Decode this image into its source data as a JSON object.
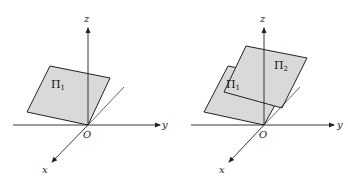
{
  "figure": {
    "colors": {
      "line": "#222222",
      "plane_fill": "#d9d9d9",
      "background": "#ffffff"
    },
    "left": {
      "axes": {
        "x_label": "x",
        "y_label": "y",
        "z_label": "z",
        "origin_label": "O"
      },
      "planes": [
        {
          "name": "Π",
          "subscript": "1"
        }
      ]
    },
    "right": {
      "axes": {
        "x_label": "x",
        "y_label": "y",
        "z_label": "z",
        "origin_label": "O"
      },
      "planes": [
        {
          "name": "Π",
          "subscript": "1"
        },
        {
          "name": "Π",
          "subscript": "2"
        }
      ]
    }
  }
}
